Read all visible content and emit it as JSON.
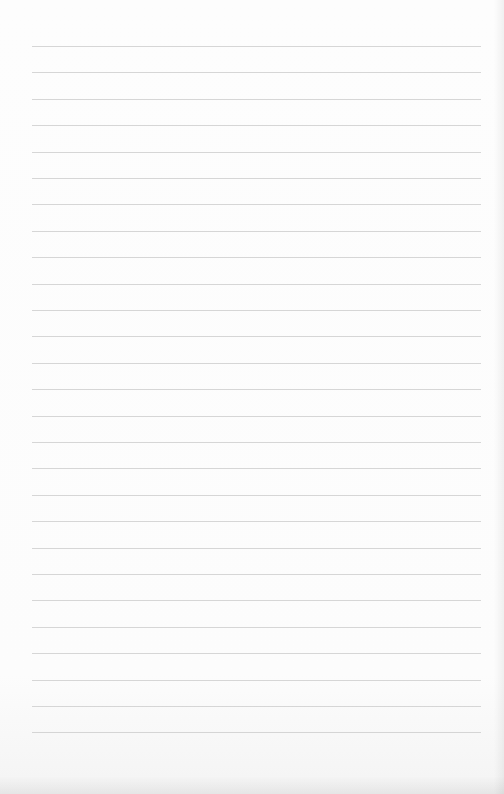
{
  "page": {
    "type": "blank lined paper",
    "line_count": 27,
    "first_line_y": 46,
    "line_spacing": 26.4,
    "line_left": 32,
    "line_width": 449,
    "line_color": "#cfcfcf",
    "paper_color": "#fdfdfd"
  }
}
